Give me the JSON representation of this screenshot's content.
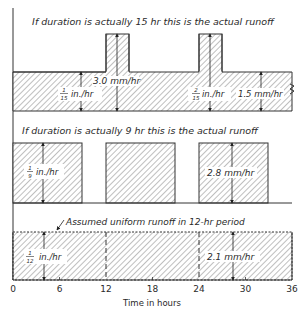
{
  "panels": {
    "top": {
      "title": "If duration is actually 15 hr this is the actual runoff",
      "label_left_num": "1",
      "label_left_den": "15",
      "label_left_unit": "in./hr",
      "label_mm": "3.0 mm/hr",
      "label_right_num": "2",
      "label_right_den": "15",
      "label_right_unit": "in./hr",
      "label_right_mm": "1.5 mm/hr",
      "base_segments_h": [
        [
          0,
          36
        ]
      ],
      "peak_segments_h": [
        [
          12,
          15
        ],
        [
          24,
          27
        ]
      ]
    },
    "middle": {
      "title": "If duration is actually 9 hr this is the actual runoff",
      "label_num": "1",
      "label_den": "9",
      "label_unit": "in./hr",
      "label_mm": "2.8 mm/hr",
      "segments_h": [
        [
          0,
          9
        ],
        [
          12,
          21
        ],
        [
          24,
          33
        ]
      ]
    },
    "bottom": {
      "title": "Assumed uniform runoff in 12-hr period",
      "label_num": "1",
      "label_den": "12",
      "label_unit": "in./hr",
      "label_mm": "2.1 mm/hr",
      "segments_h": [
        [
          0,
          36
        ]
      ],
      "dashed_dividers_h": [
        12,
        24
      ]
    }
  },
  "axis": {
    "title": "Time in hours",
    "ticks": [
      "0",
      "6",
      "12",
      "18",
      "24",
      "30",
      "36"
    ],
    "tick_values": [
      0,
      6,
      12,
      18,
      24,
      30,
      36
    ],
    "range": [
      0,
      36
    ]
  },
  "colors": {
    "ink": "#333333",
    "paper": "#ffffff"
  }
}
